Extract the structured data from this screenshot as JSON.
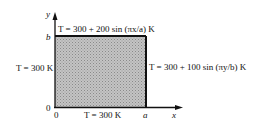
{
  "diagram": {
    "axes": {
      "x_label": "x",
      "y_label": "y",
      "origin_x_label": "0",
      "origin_y_label": "0",
      "x_end_label": "a",
      "y_end_label": "b"
    },
    "boundaries": {
      "top": "T = 300  +  200 sin (πx/a) K",
      "right": "T = 300  + 100 sin (πy/b) K",
      "left": "T = 300 K",
      "bottom": "T = 300 K"
    },
    "colors": {
      "fill": "#b8b8b8",
      "edge": "#111111"
    }
  }
}
